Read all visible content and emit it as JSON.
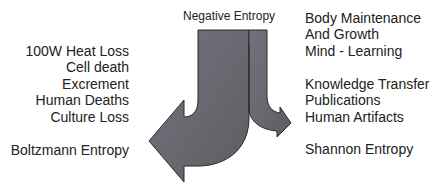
{
  "diagram": {
    "top_label": "Negative Entropy",
    "left": {
      "items": [
        "100W Heat Loss",
        "Cell death",
        "Excrement",
        "Human Deaths",
        "Culture Loss"
      ],
      "footer": "Boltzmann Entropy"
    },
    "right": {
      "group1": [
        "Body Maintenance",
        "And Growth",
        "Mind - Learning"
      ],
      "group2": [
        "Knowledge Transfer",
        "Publications",
        "Human Artifacts"
      ],
      "footer": "Shannon Entropy"
    },
    "colors": {
      "arrow_fill": "#6d6a72",
      "arrow_stroke": "#2a2a2a",
      "text": "#222222"
    }
  }
}
